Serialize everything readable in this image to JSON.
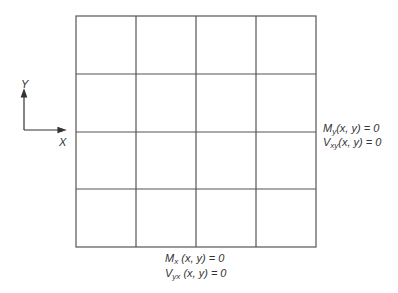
{
  "axes": {
    "x_label": "X",
    "y_label": "Y"
  },
  "grid": {
    "rows": 4,
    "cols": 4,
    "stroke_color": "#555555"
  },
  "right_boundary": {
    "line1": {
      "sym": "M",
      "sub": "y",
      "rest": "(x, y) = 0"
    },
    "line2": {
      "sym": "V",
      "sub": "xy",
      "rest": "(x, y) = 0"
    }
  },
  "bottom_boundary": {
    "line1": {
      "sym": "M",
      "sub": "x",
      "rest": " (x, y) = 0"
    },
    "line2": {
      "sym": "V",
      "sub": "yx",
      "rest": " (x, y) = 0"
    }
  }
}
